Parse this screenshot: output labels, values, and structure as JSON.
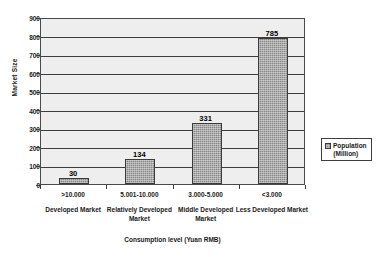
{
  "chart_data": {
    "type": "bar",
    "title": "",
    "subtitle": "",
    "xlabel": "Consumption level (Yuan RMB)",
    "ylabel": "Market Size",
    "ylim": [
      0,
      900
    ],
    "ytick_step": 100,
    "yticks": [
      "900",
      "800",
      "700",
      "600",
      "500",
      "400",
      "300",
      "200",
      "100",
      "0"
    ],
    "grid": true,
    "legend_position": "right",
    "series": [
      {
        "name": "Population (Million)",
        "name_line1": "Population",
        "name_line2": "(Million)",
        "color": "#878787",
        "values": [
          30,
          134,
          331,
          785
        ]
      }
    ],
    "categories": [
      ">10.000",
      "5.001-10.000",
      "3.000-5.000",
      "<3.000"
    ],
    "category_groups": [
      "Developed Market",
      "Relatively Developed Market",
      "Middle Developed Market",
      "Less Developed Market"
    ],
    "data_labels": [
      "30",
      "134",
      "331",
      "785"
    ],
    "plot_background": "#eeeeee",
    "gridline_color": "#3d3d3d",
    "axis_color": "#4a4a4a"
  }
}
